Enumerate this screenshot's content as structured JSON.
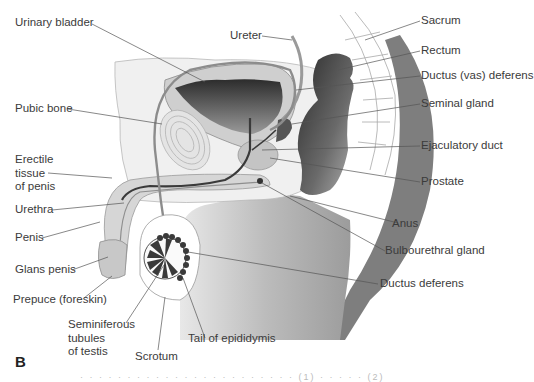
{
  "figure": {
    "panel_letter": "B",
    "caption_fragment": "· · ·  ·  · · · · · ·   · · · · ·   · · · · ·   · · ·   (1)   · · · · ·   (2)"
  },
  "labels": {
    "urinary_bladder": "Urinary bladder",
    "ureter": "Ureter",
    "sacrum": "Sacrum",
    "rectum": "Rectum",
    "ductus_vas_deferens": "Ductus (vas) deferens",
    "seminal_gland": "Seminal gland",
    "pubic_bone": "Pubic bone",
    "ejaculatory_duct": "Ejaculatory duct",
    "erectile_tissue": [
      "Erectile",
      "tissue",
      "of penis"
    ],
    "prostate": "Prostate",
    "urethra": "Urethra",
    "anus": "Anus",
    "penis": "Penis",
    "bulbourethral_gland": "Bulbourethral gland",
    "glans_penis": "Glans penis",
    "ductus_deferens": "Ductus deferens",
    "prepuce": "Prepuce (foreskin)",
    "seminiferous_tubules": [
      "Seminiferous",
      "tubules",
      "of testis"
    ],
    "tail_of_epididymis": "Tail of epididymis",
    "scrotum": "Scrotum"
  },
  "colors": {
    "leader_line": "#555555",
    "tissue_light": "#e6e6e6",
    "tissue_mid": "#c8c8c8",
    "tissue_dark": "#3a3a3a",
    "body_gray": "#b4b4b4",
    "outline": "#9a9a9a"
  }
}
